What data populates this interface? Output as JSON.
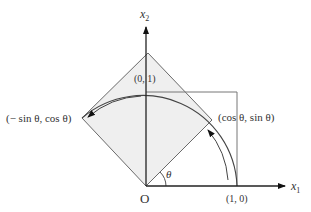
{
  "diagram": {
    "axes": {
      "x_label": "x",
      "x_sub": "1",
      "y_label": "x",
      "y_sub": "2",
      "origin_label": "O"
    },
    "points": {
      "e1": "(1, 0)",
      "e2": "(0, 1)",
      "rotated_e1": "(cos θ, sin θ)",
      "rotated_e2": "(− sin θ, cos θ)"
    },
    "angle_label": "θ",
    "colors": {
      "line": "#555555",
      "axis": "#222222",
      "fill": "#efefef"
    }
  }
}
